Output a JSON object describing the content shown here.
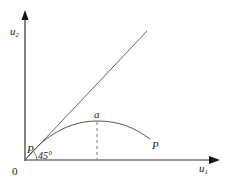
{
  "diagram": {
    "type": "utility-possibility",
    "axes": {
      "x_label": "u",
      "x_sub": "1",
      "y_label": "u",
      "y_sub": "2",
      "origin_label": "0"
    },
    "lines": [
      {
        "name": "45-degree-line",
        "angle_label": "45°"
      }
    ],
    "curve": {
      "start_label": "P",
      "end_label": "P",
      "peak_label": "a"
    },
    "colors": {
      "stroke": "#555555",
      "axis": "#333333",
      "text": "#222222"
    }
  }
}
